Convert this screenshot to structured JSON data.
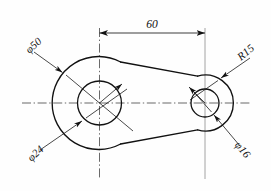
{
  "drawing": {
    "type": "mechanical-engineering-part-drawing",
    "description": "Two-hole link plate, front view",
    "background_color": "#fefefe",
    "line_color": "#111111",
    "centerline_color": "#2a2a2a",
    "extension_line_color": "#9a9a9a"
  },
  "dimensions": {
    "center_distance": {
      "label": "60",
      "value": 60,
      "kind": "linear",
      "orientation": "horizontal"
    },
    "large_outer": {
      "label": "φ50",
      "value": 50,
      "kind": "diameter",
      "symbol": "φ"
    },
    "large_bore": {
      "label": "φ24",
      "value": 24,
      "kind": "diameter",
      "symbol": "φ"
    },
    "small_outer": {
      "label": "R15",
      "value": 15,
      "kind": "radius",
      "symbol": "R"
    },
    "small_bore": {
      "label": "φ16",
      "value": 16,
      "kind": "diameter",
      "symbol": "φ"
    }
  },
  "geometry": {
    "left_circle": {
      "cx": 99.5,
      "cy": 103,
      "r_outer": 46.5,
      "r_bore": 22
    },
    "right_circle": {
      "cx": 205,
      "cy": 103,
      "r_outer": 28,
      "r_bore": 14
    },
    "horizontal_centerline": {
      "x1": 22,
      "x2": 252,
      "y": 103
    },
    "left_vertical_centerline": {
      "x": 99.5,
      "y1": 28,
      "y2": 179
    },
    "right_extension_line": {
      "x": 205,
      "y1": 28,
      "y2": 179
    },
    "dimension_line": {
      "x1": 99.5,
      "x2": 205,
      "y": 33
    }
  }
}
